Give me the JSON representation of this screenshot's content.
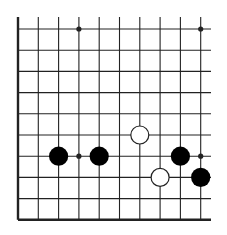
{
  "board": {
    "type": "go-board-fragment",
    "columns": 10,
    "rows": 10,
    "colors": {
      "line": "#222222",
      "background": "#ffffff",
      "black_stone": "#000000",
      "white_stone": "#ffffff",
      "white_stone_outline": "#222222"
    },
    "edges": {
      "left": true,
      "bottom": true,
      "top": false,
      "right": false
    },
    "star_points": [
      {
        "col": 3,
        "row": 0
      },
      {
        "col": 9,
        "row": 0
      },
      {
        "col": 3,
        "row": 6
      },
      {
        "col": 9,
        "row": 6
      }
    ],
    "stones": [
      {
        "color": "black",
        "col": 2,
        "row": 6
      },
      {
        "color": "black",
        "col": 4,
        "row": 6
      },
      {
        "color": "black",
        "col": 8,
        "row": 6
      },
      {
        "color": "black",
        "col": 9,
        "row": 7
      },
      {
        "color": "white",
        "col": 6,
        "row": 5
      },
      {
        "color": "white",
        "col": 7,
        "row": 7
      }
    ]
  }
}
